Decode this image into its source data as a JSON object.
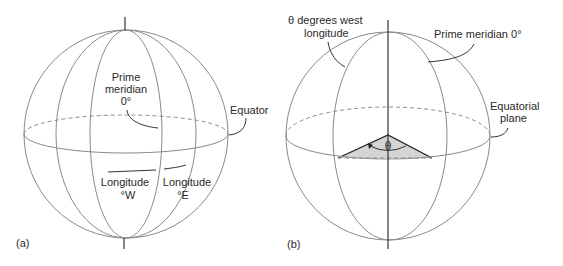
{
  "figure_a": {
    "panel_label": "(a)",
    "labels": {
      "prime_meridian_line1": "Prime",
      "prime_meridian_line2": "meridian",
      "prime_meridian_line3": "0°",
      "equator": "Equator",
      "longitude_west_line1": "Longitude",
      "longitude_west_line2": "°W",
      "longitude_east_line1": "Longitude",
      "longitude_east_line2": "°E"
    }
  },
  "figure_b": {
    "panel_label": "(b)",
    "labels": {
      "theta_west_line1": "θ degrees west",
      "theta_west_line2": "longitude",
      "prime_meridian": "Prime meridian 0°",
      "equatorial_plane_line1": "Equatorial",
      "equatorial_plane_line2": "plane",
      "theta_symbol": "θ"
    }
  },
  "colors": {
    "line": "#8a8a8a",
    "axis": "#333333",
    "wedge_fill": "#d4d4d4",
    "text": "#2a2a2a"
  }
}
